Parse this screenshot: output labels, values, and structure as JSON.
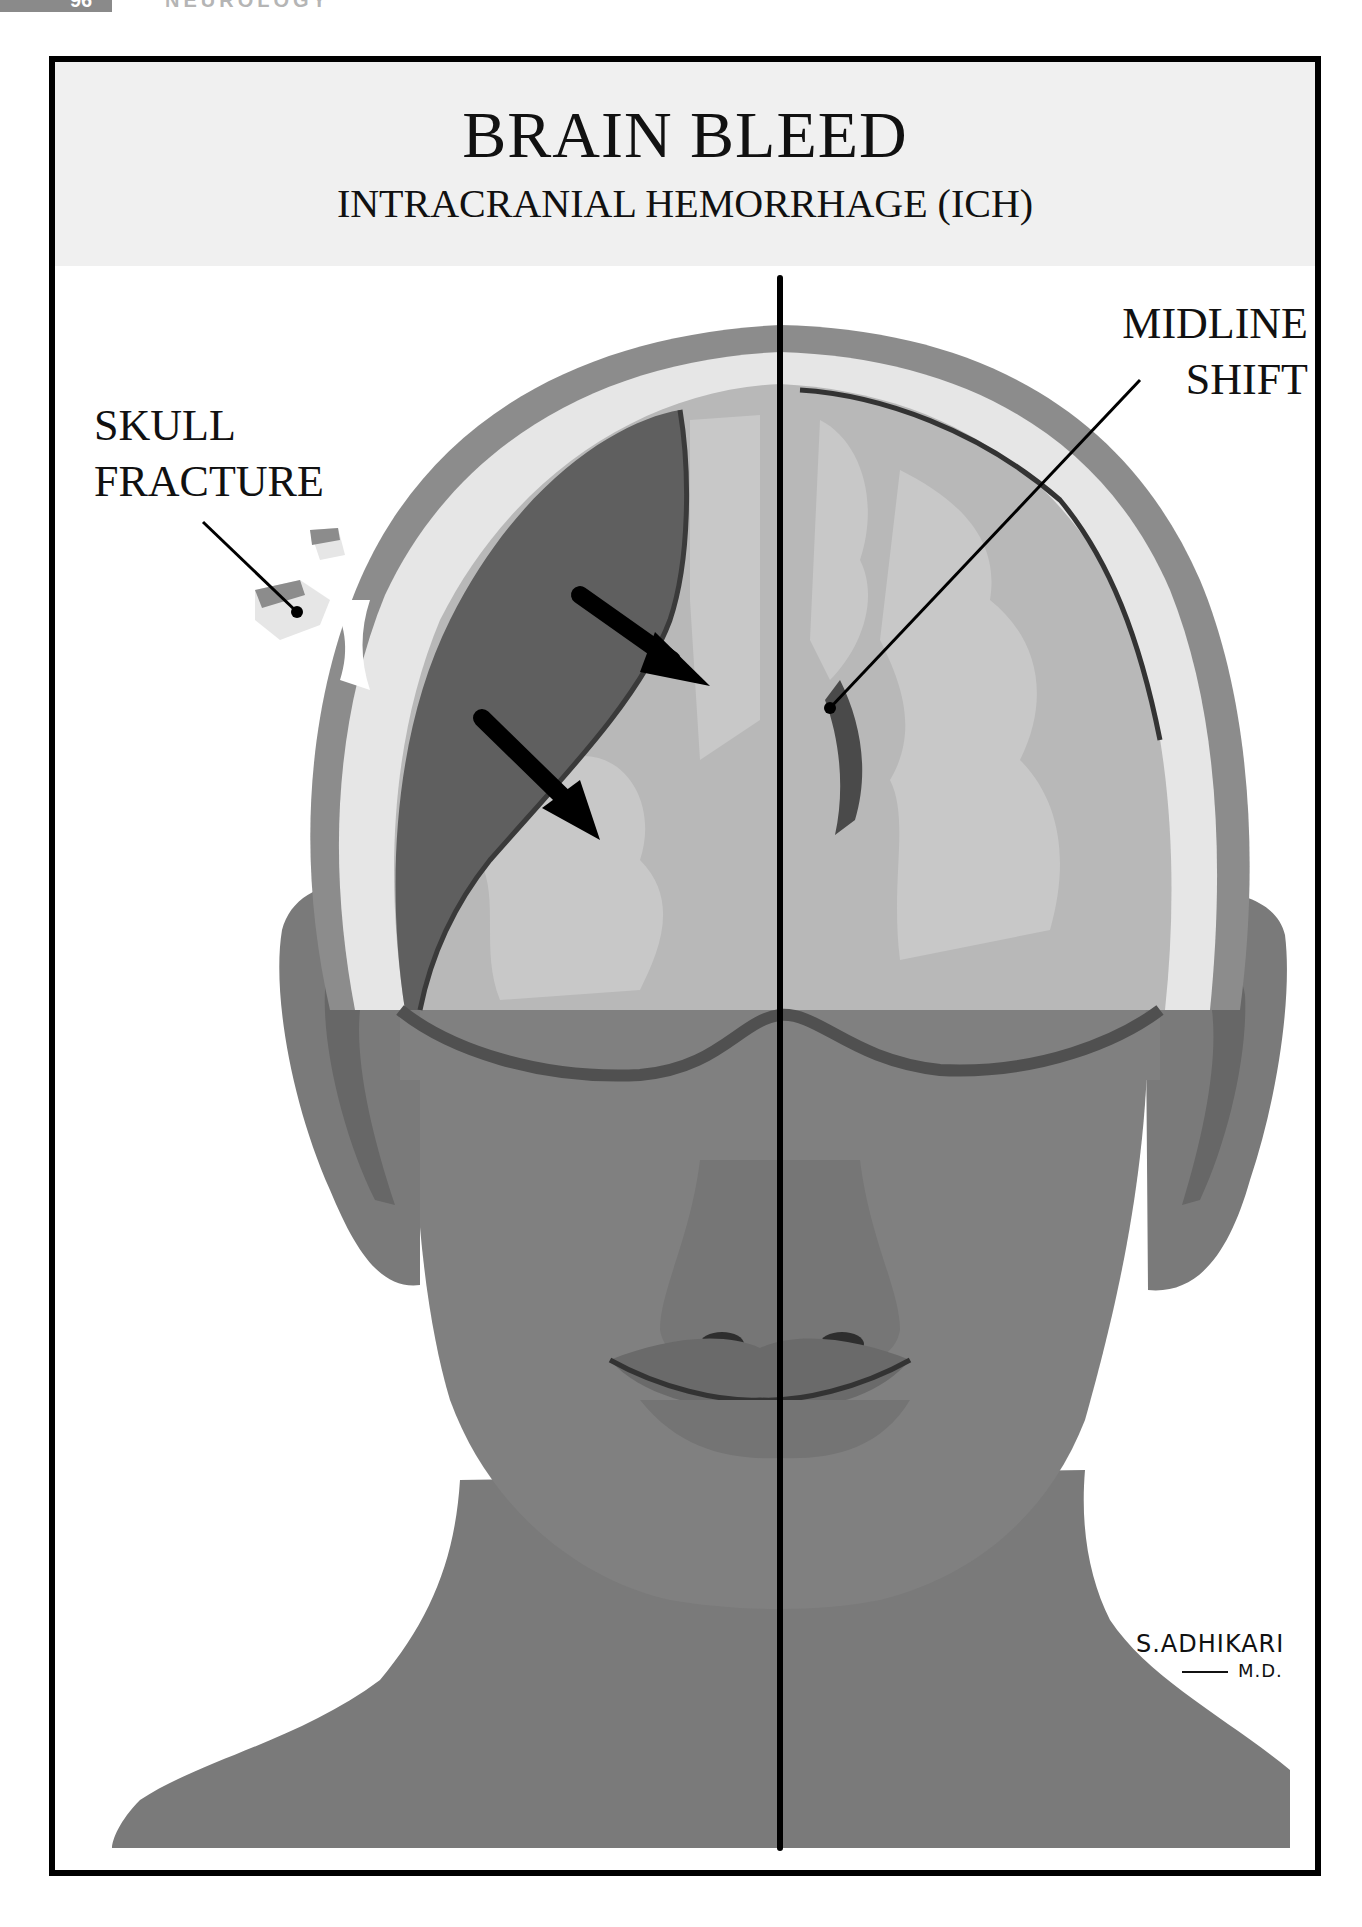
{
  "page": {
    "number": "96",
    "running_head": "NEUROLOGY"
  },
  "figure": {
    "title": "BRAIN BLEED",
    "subtitle": "INTRACRANIAL HEMORRHAGE (ICH)",
    "labels": {
      "skull_fracture": [
        "SKULL",
        "FRACTURE"
      ],
      "midline_shift": [
        "MIDLINE",
        "SHIFT"
      ]
    },
    "signature": {
      "name": "S.ADHIKARI",
      "credential": "M.D."
    },
    "colors": {
      "frame": "#000000",
      "title_band": "#f0f0f0",
      "scalp": "#8c8c8c",
      "skull": "#e6e6e6",
      "hematoma": "#5f5f5f",
      "brain": "#b8b8b8",
      "brain_white_matter": "#c8c8c8",
      "skin": "#7d7d7d",
      "midline": "#000000"
    }
  }
}
